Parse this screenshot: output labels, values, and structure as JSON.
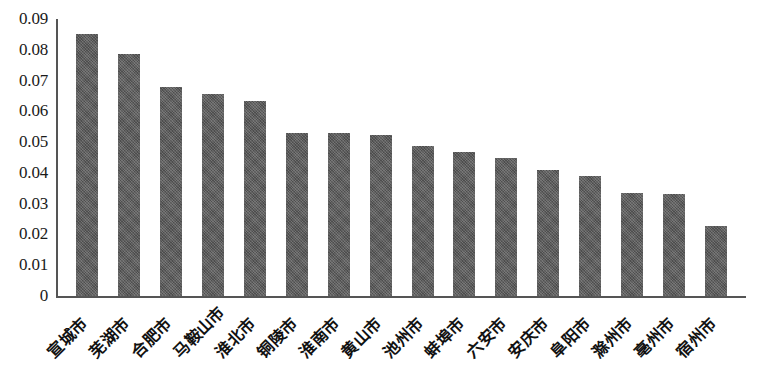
{
  "chart_data": {
    "type": "bar",
    "title": "",
    "subtitle": "",
    "xlabel": "",
    "ylabel": "",
    "ylim": [
      0,
      0.09
    ],
    "grid": false,
    "legend": null,
    "orientation": "vertical",
    "bar_color": "#5c5c5c",
    "axis_color": "#555555",
    "y_ticks": [
      "0",
      "0.01",
      "0.02",
      "0.03",
      "0.04",
      "0.05",
      "0.06",
      "0.07",
      "0.08",
      "0.09"
    ],
    "y_tick_values": [
      0,
      0.01,
      0.02,
      0.03,
      0.04,
      0.05,
      0.06,
      0.07,
      0.08,
      0.09
    ],
    "categories": [
      "宣城市",
      "芜湖市",
      "合肥市",
      "马鞍山市",
      "淮北市",
      "铜陵市",
      "淮南市",
      "黄山市",
      "池州市",
      "蚌埠市",
      "六安市",
      "安庆市",
      "阜阳市",
      "滁州市",
      "亳州市",
      "宿州市"
    ],
    "values": [
      0.085,
      0.0785,
      0.068,
      0.0655,
      0.0635,
      0.053,
      0.0529,
      0.0522,
      0.0487,
      0.0468,
      0.0447,
      0.0408,
      0.039,
      0.0335,
      0.033,
      0.0227
    ]
  }
}
